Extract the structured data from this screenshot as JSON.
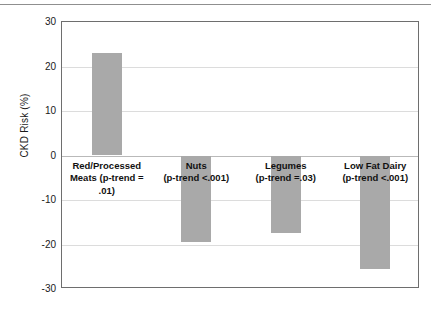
{
  "chart_data": {
    "type": "bar",
    "title": "",
    "xlabel": "",
    "ylabel": "CKD Risk (%)",
    "ylim": [
      -30,
      30
    ],
    "ytick_step": 10,
    "yticks": [
      "30",
      "20",
      "10",
      "0",
      "-10",
      "-20",
      "-30"
    ],
    "ytick_values": [
      30,
      20,
      10,
      0,
      -10,
      -20,
      -30
    ],
    "grid": true,
    "legend": "none",
    "bar_color": "#a9a9a9",
    "categories": [
      "Red/Processed Meats",
      "Nuts",
      "Legumes",
      "Low Fat Dairy"
    ],
    "values": [
      23,
      -19.5,
      -17.5,
      -25.5
    ],
    "annotations": [
      "p-trend = .01",
      "p-trend <.001",
      "p-trend =.03",
      "p-trend <.001"
    ],
    "bar_labels": [
      "Red/Processed\nMeats (p-trend =\n.01)",
      "Nuts\n(p-trend <.001)",
      "Legumes\n(p-trend =.03)",
      "Low Fat Dairy\n(p-trend <.001)"
    ]
  }
}
